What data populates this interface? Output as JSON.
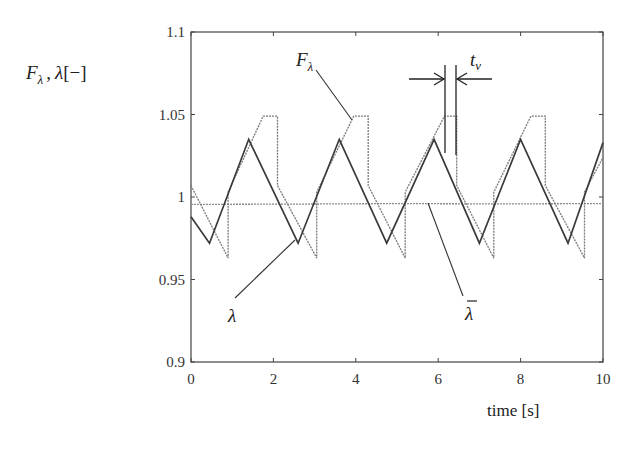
{
  "chart_data": {
    "type": "line",
    "title": "",
    "xlabel": "time [s]",
    "ylabel": "F_λ , λ[−]",
    "ylabel_parts": {
      "f": "F",
      "f_sub": "λ",
      "comma": ",",
      "lambda": "λ",
      "unit": "[−]"
    },
    "xlim": [
      0,
      10
    ],
    "ylim": [
      0.9,
      1.1
    ],
    "x_ticks": [
      0,
      2,
      4,
      6,
      8,
      10
    ],
    "x_tick_labels": [
      "0",
      "2",
      "4",
      "6",
      "8",
      "10"
    ],
    "y_ticks": [
      0.9,
      0.95,
      1.0,
      1.05,
      1.1
    ],
    "y_tick_labels": [
      "0.9",
      "0.95",
      "1",
      "1.05",
      "1.1"
    ],
    "grid": false,
    "legend": "none (inline annotations)",
    "series": [
      {
        "name": "λ",
        "style": "solid dark",
        "color": "#3a3a3a",
        "x": [
          0,
          0.45,
          1.4,
          2.6,
          3.6,
          4.75,
          5.9,
          7.0,
          8.0,
          9.15,
          10
        ],
        "y": [
          0.988,
          0.972,
          1.035,
          0.972,
          1.035,
          0.972,
          1.035,
          0.972,
          1.035,
          0.972,
          1.033
        ]
      },
      {
        "name": "F_λ",
        "style": "thin grey (dotted rendering)",
        "color": "#7a7a7a",
        "x": [
          0,
          0.9,
          0.9,
          1.75,
          2.1,
          2.1,
          3.05,
          3.05,
          3.95,
          4.3,
          4.3,
          5.2,
          5.2,
          6.15,
          6.45,
          6.45,
          7.35,
          7.35,
          8.25,
          8.6,
          8.6,
          9.55,
          9.55,
          10
        ],
        "y": [
          1.007,
          0.963,
          1.003,
          1.049,
          1.049,
          1.007,
          0.963,
          1.003,
          1.049,
          1.049,
          1.007,
          0.963,
          1.003,
          1.049,
          1.049,
          1.007,
          0.963,
          1.003,
          1.049,
          1.049,
          1.007,
          0.963,
          1.003,
          1.024
        ]
      },
      {
        "name": "λ̄",
        "style": "thin grey nearly flat",
        "color": "#8a8a8a",
        "x": [
          0,
          2.5,
          5,
          7.5,
          10
        ],
        "y": [
          0.9955,
          0.9957,
          0.996,
          0.9958,
          0.996
        ]
      }
    ],
    "annotations": [
      {
        "text": "F_λ",
        "label_main": "F",
        "label_sub": "λ",
        "points_to": [
          4.25,
          1.045
        ]
      },
      {
        "text": "λ",
        "points_to": [
          2.65,
          0.974
        ]
      },
      {
        "text": "λ̄",
        "label_main": "λ",
        "label_bar": "¯",
        "points_to": [
          5.6,
          0.996
        ]
      },
      {
        "text": "t_v",
        "label_main": "t",
        "label_sub": "v",
        "description": "plateau duration marked by two vertical lines with converging arrows at t≈6.15 and t≈6.45"
      }
    ]
  }
}
